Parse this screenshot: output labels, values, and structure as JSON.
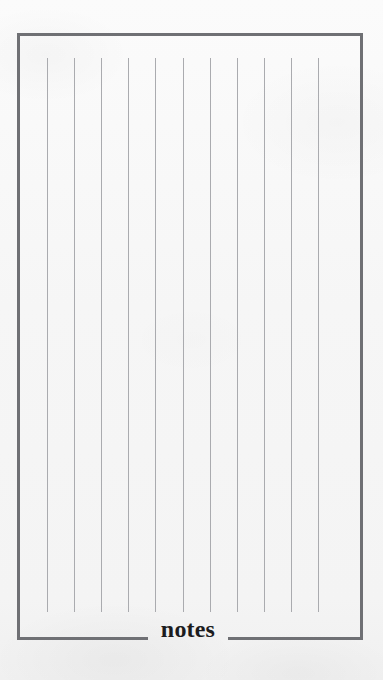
{
  "page": {
    "width": 383,
    "height": 680,
    "background_color": "#f8f8f8"
  },
  "note_card": {
    "caption": "notes",
    "frame_color": "#6f7074",
    "frame_thickness_px": 3,
    "frame": {
      "left": 17,
      "top": 33,
      "width": 346,
      "height": 607
    },
    "bottom_border": {
      "left_segment_width": 131,
      "gap_width": 80,
      "right_segment_width": 135
    },
    "rules": {
      "count": 11,
      "color": "#aaabaf",
      "width_px": 1,
      "spacing_px": 27.1,
      "first_offset_px": 30,
      "top_offset_px": 25,
      "height_px": 554,
      "positions": [
        30,
        57.1,
        84.2,
        111.3,
        138.4,
        165.5,
        192.6,
        219.7,
        246.8,
        273.9,
        301.0
      ]
    }
  }
}
